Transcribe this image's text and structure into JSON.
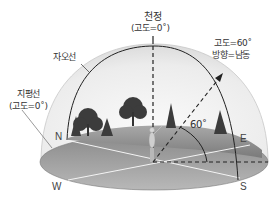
{
  "labels": {
    "zenith_title": "천정",
    "zenith_sub": "(고도=0˚)",
    "meridian": "자오선",
    "horizon_title": "지평선",
    "horizon_sub": "(고도=0˚)",
    "star_altitude": "고도=60˚",
    "star_direction": "방향=남동",
    "angle": "60˚"
  },
  "directions": {
    "north": "N",
    "east": "E",
    "south": "S",
    "west": "W"
  },
  "colors": {
    "dome_fill": "#e4e4e4",
    "ground_fill": "#9a9a9a",
    "ground_dark": "#7d7d7d",
    "line": "#222222",
    "tree": "#3a3a3a"
  }
}
